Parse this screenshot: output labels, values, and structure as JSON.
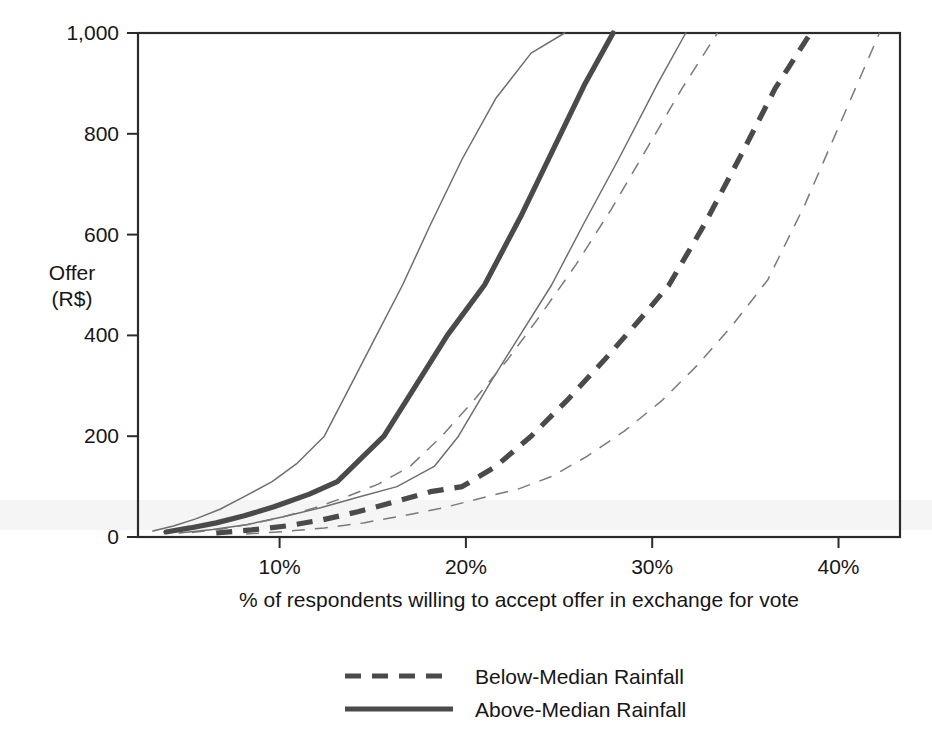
{
  "chart_data": {
    "type": "line",
    "title": "",
    "xlabel": "% of respondents willing to accept offer in exchange for vote",
    "ylabel": "Offer\n(R$)",
    "ylabel_line1": "Offer",
    "ylabel_line2": "(R$)",
    "xlim": [
      2.4,
      43.3
    ],
    "ylim": [
      0,
      1000
    ],
    "xticks": [
      10,
      20,
      30,
      40
    ],
    "xtick_labels": [
      "10%",
      "20%",
      "30%",
      "40%"
    ],
    "yticks": [
      0,
      200,
      400,
      600,
      800,
      1000
    ],
    "ytick_labels": [
      "0",
      "200",
      "400",
      "600",
      "800",
      "1,000"
    ],
    "grid": false,
    "legend_position": "below-plot-center",
    "axis_color": "#2b2b2b",
    "series": [
      {
        "name": "Above-Median Rainfall",
        "style": "solid",
        "role": "estimate",
        "stroke": "#4a4a4a",
        "x": [
          3.9,
          5.2,
          6.6,
          8.1,
          9.7,
          11.6,
          13.1,
          15.6,
          17.3,
          19.0,
          21.0,
          23.0,
          24.7,
          26.4,
          27.9
        ],
        "y": [
          10,
          18,
          28,
          42,
          60,
          85,
          110,
          200,
          300,
          400,
          500,
          640,
          770,
          900,
          1000
        ]
      },
      {
        "name": "Above-Median Rainfall lower bound",
        "style": "solid",
        "role": "ci-lower",
        "stroke": "#6e6e6e",
        "x": [
          4.6,
          6.4,
          8.3,
          10.2,
          12.2,
          14.3,
          16.3,
          18.3,
          19.6,
          21.2,
          22.9,
          24.6,
          26.3,
          28.2,
          30.3,
          31.8
        ],
        "y": [
          8,
          15,
          25,
          40,
          58,
          80,
          100,
          140,
          200,
          300,
          400,
          500,
          620,
          750,
          900,
          1000
        ]
      },
      {
        "name": "Above-Median Rainfall upper bound",
        "style": "solid",
        "role": "ci-upper",
        "stroke": "#6e6e6e",
        "x": [
          3.2,
          4.3,
          5.5,
          6.8,
          8.1,
          9.6,
          10.9,
          12.4,
          13.8,
          15.2,
          16.6,
          18.1,
          19.8,
          21.6,
          23.5,
          25.3
        ],
        "y": [
          12,
          22,
          36,
          55,
          80,
          110,
          145,
          200,
          300,
          400,
          500,
          620,
          750,
          870,
          960,
          1000
        ]
      },
      {
        "name": "Below-Median Rainfall",
        "style": "dashed",
        "role": "estimate",
        "stroke": "#4a4a4a",
        "x": [
          6.6,
          8.5,
          10.4,
          12.3,
          14.2,
          16.2,
          18.1,
          19.8,
          21.6,
          23.5,
          25.4,
          27.4,
          29.3,
          30.9,
          32.8,
          34.8,
          36.6,
          38.5
        ],
        "y": [
          8,
          14,
          22,
          34,
          50,
          70,
          90,
          100,
          140,
          200,
          270,
          350,
          430,
          500,
          620,
          760,
          890,
          1000
        ]
      },
      {
        "name": "Below-Median Rainfall lower bound",
        "style": "dashed",
        "role": "ci-lower",
        "stroke": "#7a7a7a",
        "x": [
          8.2,
          10.3,
          12.4,
          14.5,
          16.6,
          18.8,
          20.9,
          22.8,
          24.6,
          26.5,
          28.5,
          30.5,
          32.4,
          34.3,
          36.2,
          38.2,
          40.2,
          42.2
        ],
        "y": [
          6,
          11,
          18,
          28,
          42,
          58,
          78,
          95,
          120,
          160,
          210,
          270,
          340,
          420,
          510,
          660,
          830,
          1000
        ]
      },
      {
        "name": "Below-Median Rainfall upper bound",
        "style": "dashed",
        "role": "ci-upper",
        "stroke": "#7a7a7a",
        "x": [
          5.3,
          6.9,
          8.5,
          10.2,
          11.9,
          13.6,
          15.3,
          17.0,
          18.7,
          20.4,
          22.2,
          24.0,
          25.9,
          27.8,
          29.7,
          31.6,
          33.5
        ],
        "y": [
          9,
          16,
          26,
          40,
          58,
          80,
          105,
          140,
          200,
          270,
          350,
          440,
          540,
          650,
          770,
          890,
          1000
        ]
      }
    ],
    "legend": [
      {
        "label": "Below-Median Rainfall",
        "style": "dashed"
      },
      {
        "label": "Above-Median Rainfall",
        "style": "solid"
      }
    ]
  }
}
